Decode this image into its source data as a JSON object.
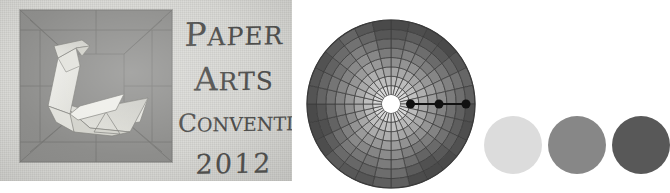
{
  "poster": {
    "background_color": "#d8d8d4",
    "artwork": {
      "name": "origami-swan",
      "panel_color": "#8d8d8b",
      "paper_light": "#e9e9e5",
      "paper_mid": "#d4d4cf",
      "paper_shadow": "#bcbcb6",
      "crease_color": "#6e6e6c"
    },
    "title_lines": [
      {
        "id": "paper",
        "text": "PAPER",
        "initial": "P",
        "rest": "APER"
      },
      {
        "id": "arts",
        "text": "ARTS",
        "initial": "A",
        "rest": "RTS"
      },
      {
        "id": "convention",
        "text": "CONVENTION",
        "initial": "C",
        "rest": "ONVENTION"
      },
      {
        "id": "year",
        "text": "2012",
        "initial": "2",
        "rest": "012"
      }
    ],
    "ink_color": "#4e4e4c"
  },
  "polar_chart": {
    "title": "",
    "center_hub_color": "#ffffff",
    "grid_line_color": "#3a3a3a",
    "radius_px": 84,
    "hub_radius_px": 9,
    "rings": 8,
    "sectors": 28,
    "shade_inner": "#e8e8e8",
    "shade_outer": "#4a4a4a",
    "markers": [
      {
        "label": "marker-1",
        "radius_fraction": 0.14,
        "angle_deg": 0,
        "color": "#111111",
        "dot_radius_px": 4.5
      },
      {
        "label": "marker-2",
        "radius_fraction": 0.52,
        "angle_deg": 0,
        "color": "#111111",
        "dot_radius_px": 4.5
      },
      {
        "label": "marker-3",
        "radius_fraction": 0.88,
        "angle_deg": 0,
        "color": "#111111",
        "dot_radius_px": 4.5
      }
    ],
    "marker_line_color": "#111111"
  },
  "swatches": {
    "count": 3,
    "items": [
      {
        "label": "swatch-light",
        "color": "#dcdcdc"
      },
      {
        "label": "swatch-medium",
        "color": "#878787"
      },
      {
        "label": "swatch-dark",
        "color": "#585858"
      }
    ]
  }
}
